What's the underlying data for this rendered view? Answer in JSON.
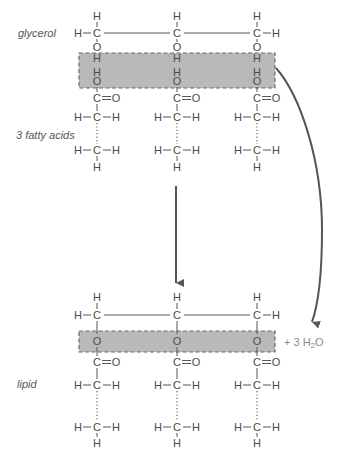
{
  "labels": {
    "glycerol": "glycerol",
    "fatty_acids": "3 fatty acids",
    "lipid": "lipid",
    "water": "+ 3 H",
    "water_sub": "2",
    "water_tail": "O"
  },
  "atoms": {
    "H": "H",
    "C": "C",
    "O": "O",
    "carbonyl": "C=O"
  },
  "colors": {
    "box_fill": "#b9b9b9",
    "box_stroke": "#6a6a6a",
    "text": "#4a4a4a",
    "arrow": "#555555"
  }
}
